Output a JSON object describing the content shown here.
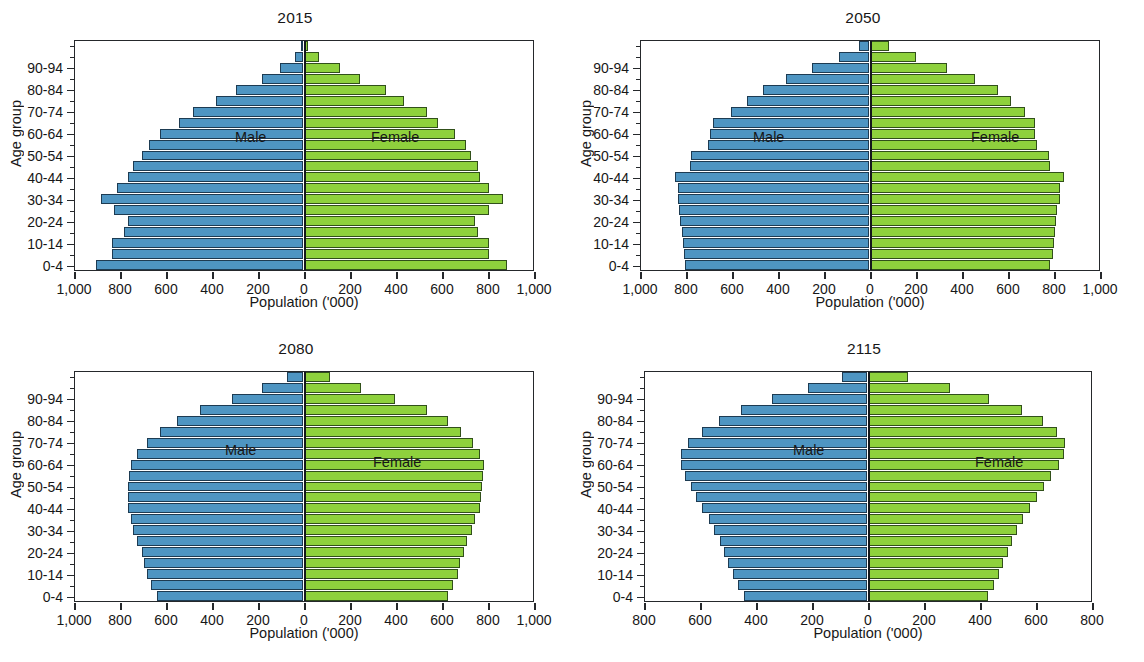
{
  "figure": {
    "background": "#ffffff",
    "male_color": "#4e95c2",
    "female_color": "#8ed13d",
    "axis_color": "#25282b"
  },
  "labels": {
    "y_axis_title": "Age group",
    "x_axis_title": "Population ('000)",
    "male": "Male",
    "female": "Female"
  },
  "age_groups": [
    "0-4",
    "5-9",
    "10-14",
    "15-19",
    "20-24",
    "25-29",
    "30-34",
    "35-39",
    "40-44",
    "45-49",
    "50-54",
    "55-59",
    "60-64",
    "65-69",
    "70-74",
    "75-79",
    "80-84",
    "85-89",
    "90-94",
    "95-99",
    "100+"
  ],
  "y_tick_labels": [
    "0-4",
    "10-14",
    "20-24",
    "30-34",
    "40-44",
    "50-54",
    "60-64",
    "70-74",
    "80-84",
    "90-94"
  ],
  "chart_data": [
    {
      "type": "bar",
      "subtype": "population-pyramid",
      "title": "2015",
      "xlabel": "Population ('000)",
      "ylabel": "Age group",
      "xlim": [
        -1000,
        1000
      ],
      "xticks": [
        -1000,
        -800,
        -600,
        -400,
        -200,
        0,
        200,
        400,
        600,
        800,
        1000
      ],
      "xtick_labels": [
        "1,000",
        "800",
        "600",
        "400",
        "200",
        "0",
        "200",
        "400",
        "600",
        "800",
        "1,000"
      ],
      "grid": false,
      "legend_position": "in-plot",
      "categories": [
        "0-4",
        "5-9",
        "10-14",
        "15-19",
        "20-24",
        "25-29",
        "30-34",
        "35-39",
        "40-44",
        "45-49",
        "50-54",
        "55-59",
        "60-64",
        "65-69",
        "70-74",
        "75-79",
        "80-84",
        "85-89",
        "90-94",
        "95-99",
        "100+"
      ],
      "series": [
        {
          "name": "Male",
          "values": [
            900,
            830,
            830,
            780,
            760,
            820,
            880,
            810,
            760,
            740,
            700,
            670,
            620,
            540,
            480,
            380,
            290,
            180,
            100,
            35,
            8
          ]
        },
        {
          "name": "Female",
          "values": [
            880,
            800,
            800,
            750,
            740,
            800,
            860,
            800,
            760,
            750,
            720,
            700,
            650,
            580,
            530,
            430,
            350,
            240,
            150,
            60,
            15
          ]
        }
      ]
    },
    {
      "type": "bar",
      "subtype": "population-pyramid",
      "title": "2050",
      "xlabel": "Population ('000)",
      "ylabel": "Age group",
      "xlim": [
        -1000,
        1000
      ],
      "xticks": [
        -1000,
        -800,
        -600,
        -400,
        -200,
        0,
        200,
        400,
        600,
        800,
        1000
      ],
      "xtick_labels": [
        "1,000",
        "800",
        "600",
        "400",
        "200",
        "0",
        "200",
        "400",
        "600",
        "800",
        "1,000"
      ],
      "grid": false,
      "legend_position": "in-plot",
      "categories": [
        "0-4",
        "5-9",
        "10-14",
        "15-19",
        "20-24",
        "25-29",
        "30-34",
        "35-39",
        "40-44",
        "45-49",
        "50-54",
        "55-59",
        "60-64",
        "65-69",
        "70-74",
        "75-79",
        "80-84",
        "85-89",
        "90-94",
        "95-99",
        "100+"
      ],
      "series": [
        {
          "name": "Male",
          "values": [
            800,
            805,
            810,
            815,
            820,
            825,
            830,
            830,
            845,
            780,
            775,
            700,
            690,
            680,
            600,
            530,
            460,
            360,
            250,
            130,
            45
          ]
        },
        {
          "name": "Female",
          "values": [
            780,
            790,
            795,
            800,
            805,
            810,
            820,
            820,
            840,
            780,
            775,
            720,
            715,
            715,
            670,
            610,
            550,
            450,
            330,
            195,
            80
          ]
        }
      ]
    },
    {
      "type": "bar",
      "subtype": "population-pyramid",
      "title": "2080",
      "xlabel": "Population ('000)",
      "ylabel": "Age group",
      "xlim": [
        -1000,
        1000
      ],
      "xticks": [
        -1000,
        -800,
        -600,
        -400,
        -200,
        0,
        200,
        400,
        600,
        800,
        1000
      ],
      "xtick_labels": [
        "1,000",
        "800",
        "600",
        "400",
        "200",
        "0",
        "200",
        "400",
        "600",
        "800",
        "1,000"
      ],
      "grid": false,
      "legend_position": "in-plot",
      "categories": [
        "0-4",
        "5-9",
        "10-14",
        "15-19",
        "20-24",
        "25-29",
        "30-34",
        "35-39",
        "40-44",
        "45-49",
        "50-54",
        "55-59",
        "60-64",
        "65-69",
        "70-74",
        "75-79",
        "80-84",
        "85-89",
        "90-94",
        "95-99",
        "100+"
      ],
      "series": [
        {
          "name": "Male",
          "values": [
            635,
            660,
            680,
            690,
            700,
            720,
            740,
            750,
            760,
            760,
            760,
            755,
            750,
            720,
            680,
            620,
            550,
            450,
            310,
            180,
            70
          ]
        },
        {
          "name": "Female",
          "values": [
            620,
            645,
            665,
            675,
            690,
            705,
            725,
            740,
            760,
            765,
            770,
            775,
            780,
            760,
            730,
            680,
            620,
            530,
            390,
            245,
            110
          ]
        }
      ]
    },
    {
      "type": "bar",
      "subtype": "population-pyramid",
      "title": "2115",
      "xlabel": "Population ('000)",
      "ylabel": "Age group",
      "xlim": [
        -800,
        800
      ],
      "xticks": [
        -800,
        -600,
        -400,
        -200,
        0,
        200,
        400,
        600,
        800
      ],
      "xtick_labels": [
        "800",
        "600",
        "400",
        "200",
        "0",
        "200",
        "400",
        "600",
        "800"
      ],
      "grid": false,
      "legend_position": "in-plot",
      "categories": [
        "0-4",
        "5-9",
        "10-14",
        "15-19",
        "20-24",
        "25-29",
        "30-34",
        "35-39",
        "40-44",
        "45-49",
        "50-54",
        "55-59",
        "60-64",
        "65-69",
        "70-74",
        "75-79",
        "80-84",
        "85-89",
        "90-94",
        "95-99",
        "100+"
      ],
      "series": [
        {
          "name": "Male",
          "values": [
            440,
            460,
            480,
            495,
            510,
            525,
            545,
            565,
            590,
            610,
            630,
            650,
            665,
            665,
            640,
            590,
            530,
            450,
            340,
            210,
            90
          ]
        },
        {
          "name": "Female",
          "values": [
            425,
            445,
            465,
            480,
            495,
            510,
            530,
            550,
            575,
            600,
            625,
            650,
            680,
            695,
            700,
            670,
            620,
            545,
            430,
            290,
            140
          ]
        }
      ]
    }
  ]
}
